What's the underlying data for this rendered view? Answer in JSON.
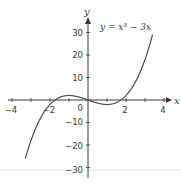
{
  "chart_data": {
    "type": "line",
    "title": "",
    "function": "y = x^3 - 3x",
    "annotation": "y = x³ − 3x",
    "xlabel": "x",
    "ylabel": "y",
    "xlim": [
      -4.2,
      4.6
    ],
    "ylim": [
      -30,
      35
    ],
    "grid": false,
    "legend_position": "none",
    "x_ticks": [
      -4,
      -3,
      -2,
      -1,
      0,
      1,
      2,
      3,
      4
    ],
    "x_tick_labels": [
      "-4",
      "-2",
      "0",
      "2",
      "4"
    ],
    "y_ticks": [
      -30,
      -20,
      -10,
      0,
      10,
      20,
      30
    ],
    "y_tick_labels": [
      "-30",
      "-20",
      "-10",
      "10",
      "20",
      "30"
    ],
    "origin_label": "0",
    "series": [
      {
        "name": "y = x³ − 3x",
        "color": "#4a4a4a",
        "x": [
          -3.3,
          -3,
          -2.5,
          -2,
          -1.5,
          -1,
          -0.5,
          0,
          0.5,
          1,
          1.5,
          2,
          2.5,
          3,
          3.4
        ],
        "y": [
          -26.04,
          -18,
          -8.13,
          -2,
          1.13,
          2,
          1.38,
          0,
          -1.38,
          -2,
          -1.13,
          2,
          8.13,
          18,
          29.1
        ]
      }
    ],
    "key_points": {
      "local_max": [
        -1,
        2
      ],
      "local_min": [
        1,
        -2
      ],
      "roots": [
        -1.732,
        0,
        1.732
      ]
    }
  },
  "labels": {
    "x_axis": "x",
    "y_axis": "y",
    "equation": "y = x³ − 3x",
    "origin": "0",
    "x_ticks": [
      "−4",
      "−2",
      "2",
      "4"
    ],
    "y_ticks": [
      "30",
      "20",
      "10",
      "−10",
      "−20",
      "−30"
    ]
  },
  "colors": {
    "axis": "#3a3a3a",
    "curve": "#4a4a4a",
    "background": "#ffffff",
    "artifact_line": "#d8d8d8"
  }
}
